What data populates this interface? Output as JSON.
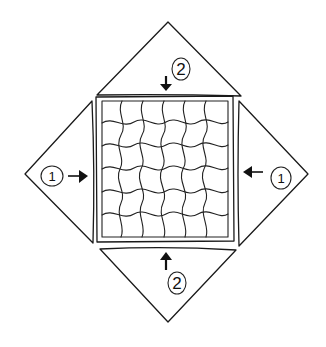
{
  "diagram": {
    "center_square": {
      "pattern": "wavy-grid-tessellation",
      "rows": 6,
      "cols": 6,
      "stroke_color": "#1a1a1a"
    },
    "flaps": [
      {
        "id": "top",
        "position": "top",
        "step_label": "2",
        "arrow_direction": "down"
      },
      {
        "id": "bottom",
        "position": "bottom",
        "step_label": "2",
        "arrow_direction": "up"
      },
      {
        "id": "left",
        "position": "left",
        "step_label": "1",
        "arrow_direction": "right"
      },
      {
        "id": "right",
        "position": "right",
        "step_label": "1",
        "arrow_direction": "left"
      }
    ],
    "colors": {
      "ink": "#1a1a1a",
      "background": "#ffffff"
    }
  }
}
